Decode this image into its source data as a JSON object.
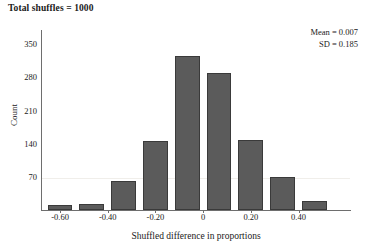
{
  "title": "Total shuffles = 1000",
  "stats": {
    "mean_line": "Mean = 0.007",
    "sd_line": "SD = 0.185"
  },
  "axes": {
    "ylabel": "Count",
    "xlabel": "Shuffled difference in proportions",
    "yticks": [
      "350",
      "280",
      "210",
      "140",
      "70"
    ],
    "xticks": [
      "-0.60",
      "-0.40",
      "-0.20",
      "0",
      "0.20",
      "0.40"
    ]
  },
  "chart_data": {
    "type": "bar",
    "title": "Total shuffles = 1000",
    "xlabel": "Shuffled difference in proportions",
    "ylabel": "Count",
    "categories": [
      -0.6,
      -0.467,
      -0.333,
      -0.2,
      -0.067,
      0.067,
      0.2,
      0.333,
      0.467
    ],
    "values": [
      10,
      12,
      62,
      145,
      325,
      290,
      148,
      70,
      18
    ],
    "bin_width": 0.133,
    "xlim": [
      -0.68,
      0.62
    ],
    "ylim": [
      0,
      380
    ],
    "xtick_values": [
      -0.6,
      -0.4,
      -0.2,
      0,
      0.2,
      0.4
    ],
    "ytick_values": [
      70,
      140,
      210,
      280,
      350
    ],
    "grid": false,
    "legend": false,
    "bar_color": "#5b5b5b",
    "bar_edge_color": "#3a3a3a",
    "annotations": [
      "Mean = 0.007",
      "SD = 0.185",
      "Total shuffles = 1000"
    ]
  }
}
